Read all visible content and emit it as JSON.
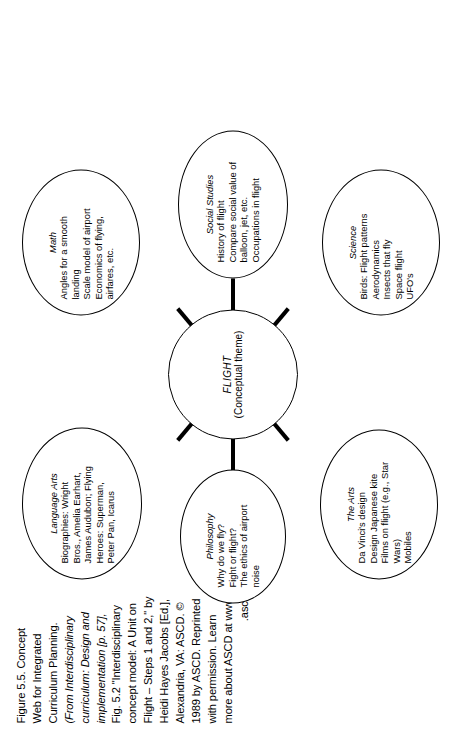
{
  "figure": {
    "id": "Figure 5.5.",
    "caption_lines": [
      "Figure 5.5. Concept",
      "Web for Integrated",
      "Curriculum Planning.",
      "(From Interdisciplinary",
      "curriculum: Design and",
      "implementation [p. 57],",
      "Fig. 5.2 \"Interdisciplinary",
      "concept model: A Unit on",
      "Flight – Steps 1 and 2,\" by",
      "Heidi Hayes Jacobs [Ed.],",
      "Alexandria, VA: ASCD. ©",
      "1989 by ASCD. Reprinted",
      "with permission. Learn",
      "more about ASCD at www",
      ".ascd.org.)"
    ],
    "caption_title": "Figure 5.5. Concept Web for Integrated Curriculum Planning.",
    "caption_source": "(From Interdisciplinary curriculum: Design and implementation [p. 57], Fig. 5.2 \"Interdisciplinary concept model: A Unit on Flight – Steps 1 and 2,\" by Heidi Hayes Jacobs [Ed.], Alexandria, VA: ASCD. © 1989 by ASCD. Reprinted with permission. Learn more about ASCD at www.ascd.org.)",
    "rotation": "90",
    "stroke_color": "#000000",
    "background_color": "#ffffff"
  },
  "diagram": {
    "type": "concept-web",
    "center": {
      "title": "FLIGHT",
      "lines": [
        "(Conceptual theme)"
      ]
    },
    "nodes": [
      {
        "key": "math",
        "title": "Math",
        "lines": [
          "Angles for a smooth",
          "landing",
          "Scale model of airport",
          "Economics of flying,",
          "airfares, etc."
        ]
      },
      {
        "key": "science",
        "title": "Science",
        "lines": [
          "Birds: Flight patterns",
          "Aerodynamics",
          "Insects that fly",
          "Space flight",
          "UFO's"
        ]
      },
      {
        "key": "philosophy",
        "title": "Philosophy",
        "lines": [
          "Why do we fly?",
          "Fight or flight?",
          "The ethics of airport",
          "noise"
        ]
      },
      {
        "key": "social-studies",
        "title": "Social Studies",
        "lines": [
          "History of flight",
          "Compare social value of",
          "balloon, jet, etc.",
          "Occupations in flight"
        ]
      },
      {
        "key": "the-arts",
        "title": "The Arts",
        "lines": [
          "Da Vinci's design",
          "Design Japanese kite",
          "Films on flight (e.g., Star",
          "Wars)",
          "Mobiles"
        ]
      },
      {
        "key": "language-arts",
        "title": "Language Arts",
        "lines": [
          "Biographies: Wright",
          "Bros., Amelia Earhart,",
          "James Audubon; Flying",
          "Heroes: Superman,",
          "Peter Pan, Icarus"
        ]
      }
    ],
    "edges": [
      {
        "from": "flight",
        "to": "math"
      },
      {
        "from": "flight",
        "to": "science"
      },
      {
        "from": "flight",
        "to": "philosophy"
      },
      {
        "from": "flight",
        "to": "social-studies"
      },
      {
        "from": "flight",
        "to": "the-arts"
      },
      {
        "from": "flight",
        "to": "language-arts"
      }
    ]
  }
}
